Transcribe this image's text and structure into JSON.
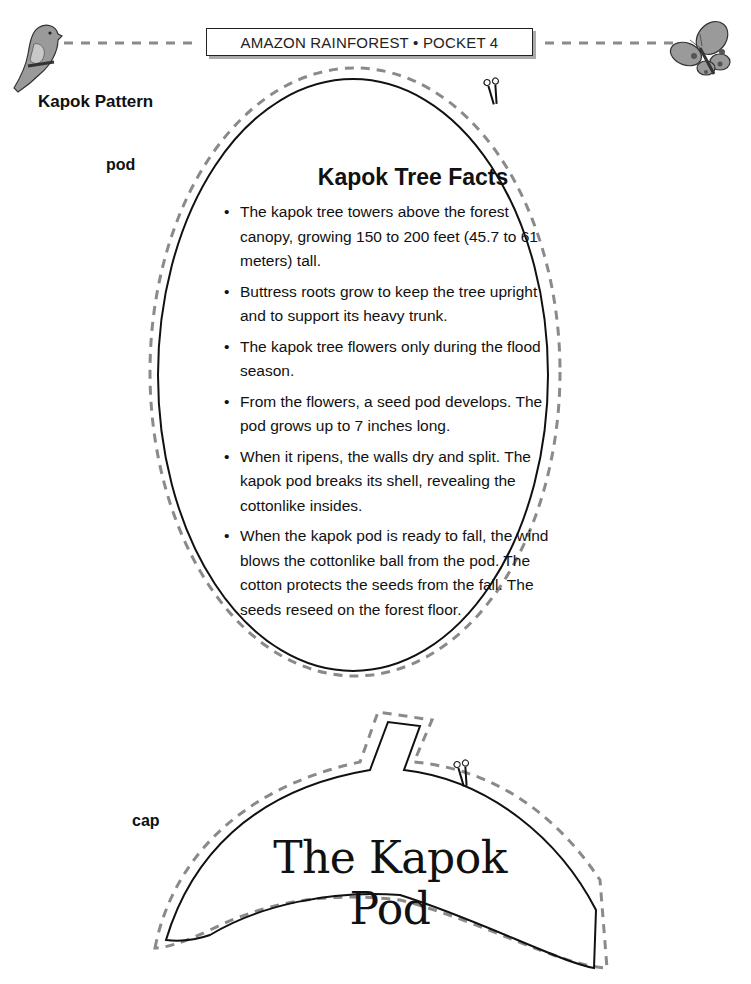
{
  "header": {
    "title": "AMAZON RAINFOREST • POCKET 4",
    "left_icon": "parrot-icon",
    "right_icon": "butterfly-icon"
  },
  "page": {
    "section_title": "Kapok Pattern"
  },
  "pod": {
    "label": "pod",
    "facts_title": "Kapok Tree Facts",
    "facts": [
      "The kapok tree towers above the forest canopy, growing 150 to 200 feet (45.7 to 61 meters) tall.",
      "Buttress roots grow to keep the tree upright and to support its heavy trunk.",
      "The kapok tree flowers only during the flood season.",
      "From the flowers, a seed pod develops. The pod grows up to 7 inches long.",
      "When it ripens, the walls dry and split. The kapok pod breaks its shell, revealing the cottonlike insides.",
      "When the kapok pod is ready to fall, the wind blows the cottonlike ball from the pod. The cotton protects the seeds from the fall. The seeds reseed on the forest floor."
    ],
    "cut_icon": "scissors-icon"
  },
  "cap": {
    "label": "cap",
    "title": "The Kapok Pod",
    "cut_icon": "scissors-icon"
  },
  "colors": {
    "outline": "#111111",
    "cut_line": "#8a8a8a"
  }
}
